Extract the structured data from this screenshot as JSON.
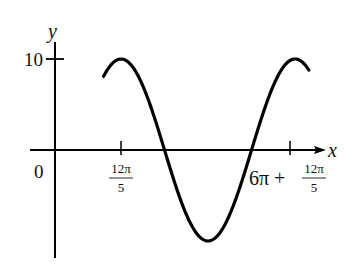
{
  "chart_data": {
    "type": "line",
    "title": "",
    "xlabel": "x",
    "ylabel": "y",
    "function_description": "sinusoid with amplitude 10, maxima at x = 12π/5 and x = 6π + 12π/5",
    "amplitude": 10,
    "period_label": "6π",
    "x_tick_labels": [
      {
        "value": 0,
        "label": "0"
      },
      {
        "value": 7.5398,
        "label_num": "12π",
        "label_den": "5"
      },
      {
        "value": 26.3894,
        "label_prefix": "6π +",
        "label_num": "12π",
        "label_den": "5"
      }
    ],
    "y_tick_labels": [
      {
        "value": 10,
        "label": "10"
      }
    ],
    "x_range_visible": [
      -3.0,
      30.0
    ],
    "ylim": [
      -11.5,
      11.5
    ],
    "curve_x_range": [
      5.6,
      28.5
    ],
    "grid": false,
    "legend": "none",
    "colors": {
      "curve": "#000000",
      "axes": "#000000",
      "text": "#111111"
    }
  }
}
